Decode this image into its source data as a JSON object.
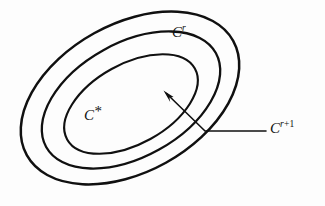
{
  "figure": {
    "background_color": "#fdfdfd",
    "stroke_color": "#101010",
    "width": 325,
    "height": 206
  },
  "labels": {
    "inner": {
      "base": "C",
      "superscript": "*",
      "full_text": "C*"
    },
    "middle": {
      "base": "C",
      "superscript": "r",
      "full_text": "Cr"
    },
    "outer": {
      "base": "C",
      "superscript_italic": "r",
      "superscript_upright": "+1",
      "full_text": "Cr+1"
    }
  },
  "contours": [
    {
      "name": "inner-contour",
      "label_ref": "C*",
      "center_x": 131,
      "center_y": 104,
      "radius_x": 73,
      "radius_y": 40,
      "rotation_deg": -29,
      "stroke_width": 2.1
    },
    {
      "name": "middle-contour",
      "label_ref": "Cr",
      "center_x": 131,
      "center_y": 100,
      "radius_x": 97,
      "radius_y": 57,
      "rotation_deg": -29,
      "stroke_width": 2.3
    },
    {
      "name": "outer-contour",
      "label_ref": "Cr+1",
      "center_x": 130,
      "center_y": 98,
      "radius_x": 118,
      "radius_y": 74,
      "rotation_deg": -29,
      "stroke_width": 2.5
    }
  ],
  "annotation": {
    "name": "outer-contour-leader",
    "arrow_tip_x": 164,
    "arrow_tip_y": 91,
    "elbow_x": 205,
    "elbow_y": 131,
    "line_end_x": 266,
    "line_end_y": 131,
    "points_to": "Cr+1"
  }
}
